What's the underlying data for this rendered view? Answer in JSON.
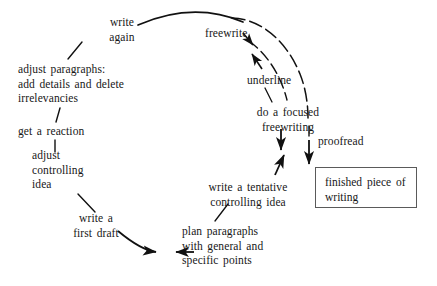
{
  "diagram": {
    "type": "cycle-flow-diagram",
    "canvas": {
      "width": 437,
      "height": 286
    },
    "background_color": "#ffffff",
    "line_color": "#111111",
    "box_border_color": "#5a5a5a",
    "text_color": "#171717",
    "nodes": [
      {
        "id": "write-again",
        "label": "write\nagain",
        "x": 93,
        "y": 15,
        "width": 58,
        "align": "center"
      },
      {
        "id": "adjust-paragraphs",
        "label": "adjust paragraphs:\nadd details and delete\nirrelevancies",
        "x": 18,
        "y": 62,
        "width": 130,
        "align": "left"
      },
      {
        "id": "get-a-reaction",
        "label": "get a reaction",
        "x": 18,
        "y": 124,
        "width": 90,
        "align": "left"
      },
      {
        "id": "adjust-controlling-idea",
        "label": "adjust\ncontrolling\nidea",
        "x": 32,
        "y": 148,
        "width": 66,
        "align": "left"
      },
      {
        "id": "write-first-draft",
        "label": "write a\nfirst draft",
        "x": 58,
        "y": 211,
        "width": 72,
        "align": "center"
      },
      {
        "id": "plan-paragraphs",
        "label": "plan paragraphs\nwith general and\nspecific points",
        "x": 182,
        "y": 224,
        "width": 105,
        "align": "left"
      },
      {
        "id": "write-tentative-controlling-idea",
        "label": "write a tentative\ncontrolling idea",
        "x": 196,
        "y": 180,
        "width": 104,
        "align": "center"
      },
      {
        "id": "do-a-focused-freewriting",
        "label": "do a focused\nfreewriting",
        "x": 245,
        "y": 105,
        "width": 86,
        "align": "center"
      },
      {
        "id": "underline",
        "label": "underline",
        "x": 247,
        "y": 73,
        "width": 62,
        "align": "left"
      },
      {
        "id": "freewrite",
        "label": "freewrite",
        "x": 205,
        "y": 26,
        "width": 58,
        "align": "left"
      },
      {
        "id": "proofread",
        "label": "proofread",
        "x": 318,
        "y": 134,
        "width": 62,
        "align": "left"
      }
    ],
    "outcome_box": {
      "id": "finished-piece",
      "label": "finished piece of\nwriting",
      "x": 315,
      "y": 167,
      "width": 102,
      "height": 41
    }
  }
}
